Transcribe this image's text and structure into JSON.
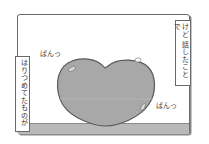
{
  "panel": {
    "caption_right": "けど 話したことで",
    "caption_left": "はりつめてたものが",
    "sfx_top": "ぱんっ",
    "sfx_bottom": "ぱんっ"
  },
  "colors": {
    "heart_fill": "#a8a8a8",
    "heart_stroke": "#5a5a5a",
    "floor": "#b9b9b9",
    "frame": "#6a6a6a"
  }
}
